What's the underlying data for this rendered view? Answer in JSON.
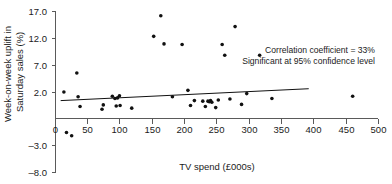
{
  "chart_data": {
    "type": "scatter",
    "title": "",
    "xlabel": "TV spend (£000s)",
    "ylabel": "Week-on-week uplift in Saturday sales (%)",
    "ylabel_lines": [
      "Week-on-week uplift in",
      "Saturday sales (%)"
    ],
    "xlim": [
      0,
      500
    ],
    "ylim": [
      -8.0,
      17.0
    ],
    "xticks": [
      0,
      50,
      100,
      150,
      200,
      250,
      300,
      350,
      400,
      450,
      500
    ],
    "xticklabels": [
      "0",
      "50",
      "100",
      "150",
      "200",
      "250",
      "300",
      "350",
      "400",
      "450",
      "500"
    ],
    "yticks": [
      -8.0,
      -3.0,
      2.0,
      7.0,
      12.0,
      17.0
    ],
    "yticklabels": [
      "–8.0",
      "–3.0",
      "2.0",
      "7.0",
      "12.0",
      "17.0"
    ],
    "grid": false,
    "legend": "none",
    "points": [
      {
        "x": 13,
        "y": 2.1
      },
      {
        "x": 17,
        "y": -5.4
      },
      {
        "x": 25,
        "y": -6.0
      },
      {
        "x": 33,
        "y": 5.6
      },
      {
        "x": 35,
        "y": 1.2
      },
      {
        "x": 38,
        "y": -0.6
      },
      {
        "x": 72,
        "y": -1.1
      },
      {
        "x": 74,
        "y": -0.3
      },
      {
        "x": 88,
        "y": 1.3
      },
      {
        "x": 92,
        "y": 0.9
      },
      {
        "x": 94,
        "y": -0.5
      },
      {
        "x": 96,
        "y": 1.0
      },
      {
        "x": 99,
        "y": 1.4
      },
      {
        "x": 100,
        "y": -0.4
      },
      {
        "x": 118,
        "y": -0.9
      },
      {
        "x": 152,
        "y": 12.4
      },
      {
        "x": 163,
        "y": 16.2
      },
      {
        "x": 168,
        "y": 11.0
      },
      {
        "x": 181,
        "y": 1.2
      },
      {
        "x": 196,
        "y": 10.9
      },
      {
        "x": 205,
        "y": 2.4
      },
      {
        "x": 209,
        "y": -0.4
      },
      {
        "x": 215,
        "y": 0.5
      },
      {
        "x": 228,
        "y": 0.4
      },
      {
        "x": 232,
        "y": -0.6
      },
      {
        "x": 236,
        "y": 0.4
      },
      {
        "x": 238,
        "y": 0.3
      },
      {
        "x": 240,
        "y": 0.5
      },
      {
        "x": 242,
        "y": 0.2
      },
      {
        "x": 248,
        "y": -0.8
      },
      {
        "x": 252,
        "y": 0.6
      },
      {
        "x": 258,
        "y": 10.9
      },
      {
        "x": 262,
        "y": 8.9
      },
      {
        "x": 270,
        "y": 0.8
      },
      {
        "x": 278,
        "y": 14.2
      },
      {
        "x": 288,
        "y": -0.2
      },
      {
        "x": 296,
        "y": 1.8
      },
      {
        "x": 316,
        "y": 8.9
      },
      {
        "x": 335,
        "y": 0.9
      },
      {
        "x": 460,
        "y": 1.3
      }
    ],
    "trendline": {
      "x_start": 8,
      "y_start": 0.5,
      "x_end": 392,
      "y_end": 2.7
    },
    "annotations": [
      "Correlation coefficient = 33%",
      "Significant at 95% confidence level"
    ],
    "correlation_coefficient": "33%",
    "confidence_level": "95%"
  },
  "colors": {
    "point": "#111111",
    "axis": "#5a5a5a",
    "trend": "#111111",
    "text": "#1b1b1b",
    "background": "#ffffff"
  }
}
